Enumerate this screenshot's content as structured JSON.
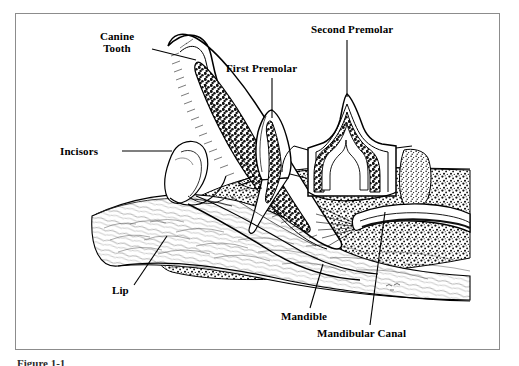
{
  "figure": {
    "caption": "Figure 1-1",
    "background_color": "#ffffff",
    "frame_color": "#8c8c8c",
    "ink_color": "#000000",
    "frame": {
      "x": 15,
      "y": 13,
      "width": 485,
      "height": 337
    }
  },
  "labels": [
    {
      "id": "canine-tooth",
      "text": "Canine\nTooth",
      "x": 84,
      "y": 30,
      "leader": {
        "type": "line",
        "x1": 152,
        "y1": 49,
        "x2": 196,
        "y2": 60
      }
    },
    {
      "id": "incisors",
      "text": "Incisors",
      "x": 60,
      "y": 145,
      "leader": {
        "type": "line",
        "x1": 122,
        "y1": 151,
        "x2": 172,
        "y2": 151
      }
    },
    {
      "id": "first-premolar",
      "text": "First Premolar",
      "x": 226,
      "y": 62,
      "leader": {
        "type": "line",
        "x1": 272,
        "y1": 78,
        "x2": 272,
        "y2": 118
      }
    },
    {
      "id": "second-premolar",
      "text": "Second Premolar",
      "x": 311,
      "y": 23,
      "leader": {
        "type": "line",
        "x1": 347,
        "y1": 40,
        "x2": 347,
        "y2": 97
      }
    },
    {
      "id": "lip",
      "text": "Lip",
      "x": 112,
      "y": 284,
      "leader": {
        "type": "line",
        "x1": 134,
        "y1": 285,
        "x2": 167,
        "y2": 236
      }
    },
    {
      "id": "mandible",
      "text": "Mandible",
      "x": 281,
      "y": 310,
      "leader": {
        "type": "line",
        "x1": 310,
        "y1": 308,
        "x2": 323,
        "y2": 264
      }
    },
    {
      "id": "mandibular-canal",
      "text": "Mandibular Canal",
      "x": 317,
      "y": 327,
      "leader": {
        "type": "line",
        "x1": 370,
        "y1": 325,
        "x2": 385,
        "y2": 212
      }
    }
  ],
  "anatomy": {
    "structures": [
      "canine tooth",
      "incisors",
      "first premolar",
      "second premolar",
      "lip",
      "mandible",
      "mandibular canal",
      "alveolar bone",
      "pulp cavity",
      "gingiva"
    ]
  }
}
